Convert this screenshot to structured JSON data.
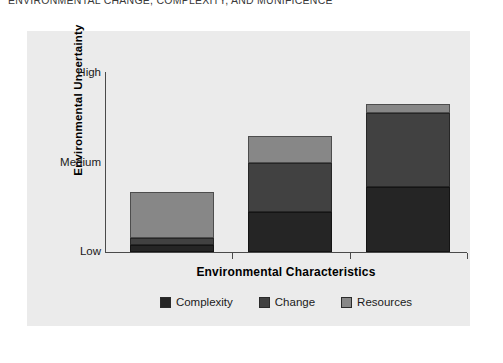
{
  "figure": {
    "title": "ENVIRONMENTAL CHANGE, COMPLEXITY, AND MUNIFICENCE"
  },
  "chart_data": {
    "type": "bar",
    "subtype": "stacked",
    "title": "",
    "xlabel": "Environmental Characteristics",
    "ylabel": "Environmental Uncertainty",
    "categories": [
      "",
      "",
      ""
    ],
    "ytick_labels": [
      "Low",
      "Medium",
      "High"
    ],
    "ytick_values": [
      0,
      50,
      100
    ],
    "ylim": [
      0,
      100
    ],
    "grid": false,
    "legend_position": "bottom",
    "series": [
      {
        "name": "Complexity",
        "color": "#252525",
        "values": [
          4,
          22,
          36
        ]
      },
      {
        "name": "Change",
        "color": "#414141",
        "values": [
          4,
          27,
          41
        ]
      },
      {
        "name": "Resources",
        "color": "#878787",
        "values": [
          25,
          15,
          5
        ]
      }
    ],
    "totals": [
      33,
      64,
      82
    ],
    "panel_background": "#ebebeb"
  },
  "legend": {
    "items": [
      {
        "label": "Complexity",
        "color": "#252525"
      },
      {
        "label": "Change",
        "color": "#414141"
      },
      {
        "label": "Resources",
        "color": "#878787"
      }
    ]
  }
}
